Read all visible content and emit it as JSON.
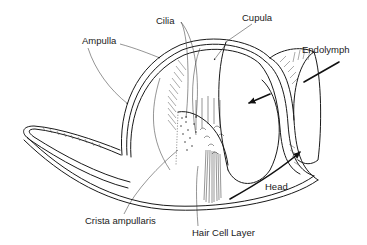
{
  "figure": {
    "type": "anatomical-diagram",
    "colors": {
      "ink": "#1a1a1a",
      "background": "#ffffff"
    }
  },
  "labels": {
    "cilia": "Cilia",
    "cupula": "Cupula",
    "ampulla": "Ampulla",
    "endolymph": "Endolymph",
    "crista": "Crista ampullaris",
    "hair_cell_layer": "Hair Cell Layer",
    "head": "Head"
  }
}
